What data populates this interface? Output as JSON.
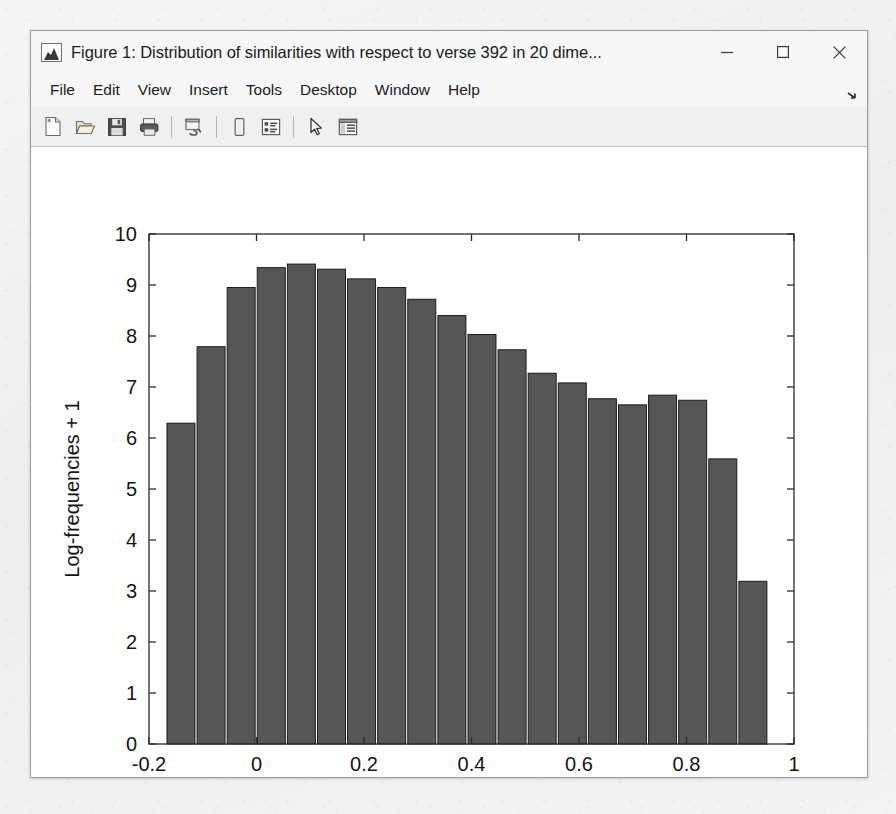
{
  "window": {
    "title": "Figure 1: Distribution of similarities with respect to verse 392 in 20 dime...",
    "app_icon": "matlab-membrane-icon",
    "minimize_label": "–",
    "maximize_label": "□",
    "close_label": "✕"
  },
  "menubar": {
    "items": [
      {
        "label": "File",
        "name": "menu-file"
      },
      {
        "label": "Edit",
        "name": "menu-edit"
      },
      {
        "label": "View",
        "name": "menu-view"
      },
      {
        "label": "Insert",
        "name": "menu-insert"
      },
      {
        "label": "Tools",
        "name": "menu-tools"
      },
      {
        "label": "Desktop",
        "name": "menu-desktop"
      },
      {
        "label": "Window",
        "name": "menu-window"
      },
      {
        "label": "Help",
        "name": "menu-help"
      }
    ],
    "overflow_icon": "overflow-arrow-icon"
  },
  "toolbar": {
    "buttons": [
      {
        "icon": "new-figure-icon",
        "tooltip": "New Figure"
      },
      {
        "icon": "open-file-icon",
        "tooltip": "Open File"
      },
      {
        "icon": "save-figure-icon",
        "tooltip": "Save Figure"
      },
      {
        "icon": "print-figure-icon",
        "tooltip": "Print Figure"
      },
      {
        "icon": "link-plot-icon",
        "tooltip": "Link Plot"
      },
      {
        "icon": "colorbar-icon",
        "tooltip": "Insert Colorbar"
      },
      {
        "icon": "legend-icon",
        "tooltip": "Insert Legend"
      },
      {
        "icon": "edit-plot-pointer-icon",
        "tooltip": "Edit Plot"
      },
      {
        "icon": "plot-browser-icon",
        "tooltip": "Show Plot Tools"
      }
    ]
  },
  "chart_data": {
    "type": "bar",
    "title": "",
    "xlabel": "Cosine Association Scores",
    "ylabel": "Log-frequencies + 1",
    "xlim": [
      -0.2,
      1.0
    ],
    "ylim": [
      0,
      10
    ],
    "grid": false,
    "legend": null,
    "bar_color": "#565656",
    "bar_edge_color": "#1a1a1a",
    "xticks": [
      -0.2,
      0,
      0.2,
      0.4,
      0.6,
      0.8,
      1
    ],
    "xticklabels": [
      "-0.2",
      "0",
      "0.2",
      "0.4",
      "0.6",
      "0.8",
      "1"
    ],
    "yticks": [
      0,
      1,
      2,
      3,
      4,
      5,
      6,
      7,
      8,
      9,
      10
    ],
    "yticklabels": [
      "0",
      "1",
      "2",
      "3",
      "4",
      "5",
      "6",
      "7",
      "8",
      "9",
      "10"
    ],
    "bar_width_fraction": 0.93,
    "x": [
      -0.1405,
      -0.0845,
      -0.0285,
      0.0275,
      0.0835,
      0.1395,
      0.1955,
      0.2515,
      0.3075,
      0.3635,
      0.4195,
      0.4755,
      0.5315,
      0.5875,
      0.6435,
      0.6995,
      0.7555,
      0.8115,
      0.8675,
      0.9235
    ],
    "categories": [
      "-0.14",
      "-0.08",
      "-0.03",
      "0.03",
      "0.08",
      "0.14",
      "0.20",
      "0.25",
      "0.31",
      "0.36",
      "0.42",
      "0.48",
      "0.53",
      "0.59",
      "0.64",
      "0.70",
      "0.76",
      "0.81",
      "0.87",
      "0.92"
    ],
    "values": [
      6.29,
      7.79,
      8.95,
      9.34,
      9.41,
      9.31,
      9.12,
      8.95,
      8.72,
      8.4,
      8.03,
      7.73,
      7.27,
      7.08,
      6.77,
      6.65,
      6.84,
      6.74,
      5.59,
      3.19
    ]
  }
}
